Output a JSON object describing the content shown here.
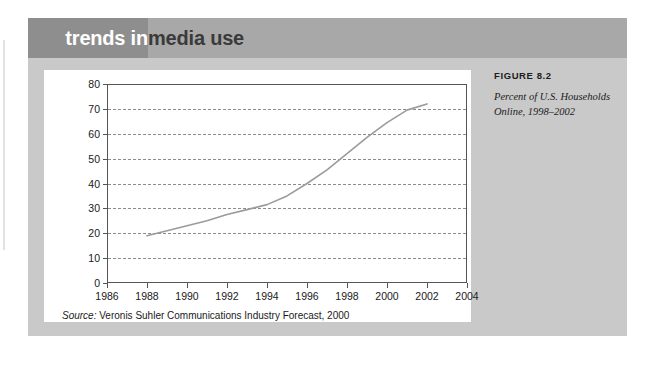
{
  "banner": {
    "title_part1": "trends in",
    "title_part2": "media use"
  },
  "figure": {
    "label": "FIGURE 8.2",
    "caption": "Percent of U.S. Households Online, 1998–2002"
  },
  "source": {
    "key": "Source:",
    "text": " Veronis Suhler Communications Industry Forecast, 2000"
  },
  "colors": {
    "banner_left": "#8e8e8e",
    "banner_right": "#a8a8a8",
    "card": "#c9c9c9",
    "panel": "#ffffff",
    "series_line": "#9b9b9b",
    "gridline": "#8c8c8c",
    "axis": "#555555"
  },
  "chart_data": {
    "type": "line",
    "title": "",
    "subtitle": "",
    "xlabel": "",
    "ylabel": "",
    "xlim": [
      1986,
      2004
    ],
    "ylim": [
      0,
      80
    ],
    "grid": true,
    "legend": false,
    "xticks": [
      1986,
      1988,
      1990,
      1992,
      1994,
      1996,
      1998,
      2000,
      2002,
      2004
    ],
    "xtick_labels": [
      "1986",
      "1988",
      "1990",
      "1992",
      "1994",
      "1996",
      "1998",
      "2000",
      "2002",
      "2004"
    ],
    "yticks": [
      0,
      10,
      20,
      30,
      40,
      50,
      60,
      70,
      80
    ],
    "ytick_labels": [
      "0",
      "10",
      "20",
      "30",
      "40",
      "50",
      "60",
      "70",
      "80"
    ],
    "series": [
      {
        "name": "Percent of U.S. households online",
        "x": [
          1988,
          1989,
          1990,
          1991,
          1992,
          1993,
          1994,
          1995,
          1996,
          1997,
          1998,
          1999,
          2000,
          2001,
          2002
        ],
        "values": [
          19,
          21,
          23,
          25,
          27.5,
          29.5,
          31.5,
          35,
          40,
          45.5,
          52,
          58.5,
          64.5,
          69.5,
          72
        ]
      }
    ],
    "annotations": [
      "Source: Veronis Suhler Communications Industry Forecast, 2000"
    ]
  }
}
